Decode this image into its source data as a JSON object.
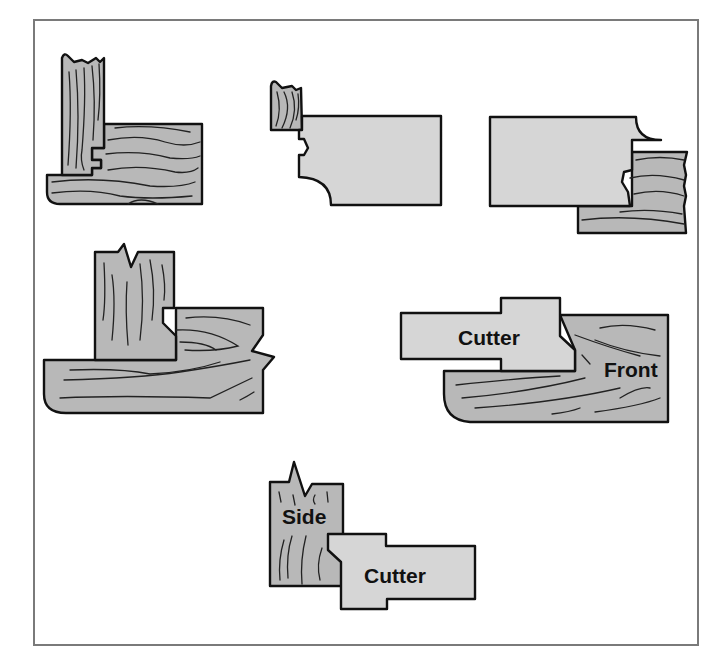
{
  "figure": {
    "colors": {
      "wood": "#b8b8b8",
      "cutter": "#d6d6d6",
      "outline": "#111111",
      "frame": "#7a7a7a"
    },
    "panels": [
      {
        "id": "joined-rail-stile",
        "labels": []
      },
      {
        "id": "cutter-with-side-stock",
        "labels": []
      },
      {
        "id": "cutter-with-front-stock",
        "labels": []
      },
      {
        "id": "stile-on-rail-split",
        "labels": []
      },
      {
        "id": "cutter-front",
        "labels": [
          "Cutter",
          "Front"
        ]
      },
      {
        "id": "side-cutter",
        "labels": [
          "Side",
          "Cutter"
        ]
      }
    ],
    "labels": {
      "front_cutter": "Cutter",
      "front": "Front",
      "side": "Side",
      "side_cutter": "Cutter"
    }
  }
}
